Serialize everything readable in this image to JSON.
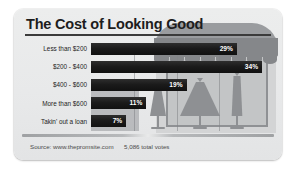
{
  "card": {
    "title": "The Cost of Looking Good",
    "footer": {
      "source_label": "Source: www.thepromsite.com",
      "votes_label": "5,086 total votes"
    }
  },
  "illustration": {
    "name": "dress-shop-storefront",
    "awning": "striped-awning-scalloped",
    "window": "shop-display-window",
    "mannequins": [
      {
        "name": "short-a-line-dress"
      },
      {
        "name": "ball-gown-dress"
      },
      {
        "name": "long-slim-gown-dress"
      }
    ]
  },
  "colors": {
    "card_background": "#eceded",
    "bar_fill": "#1a1a1a",
    "bar_value_text": "#ffffff",
    "title_text": "#1d1d1d",
    "illustration_mid": "#9a9c9f",
    "illustration_dark": "#85878a",
    "window_frame": "#8f9194"
  },
  "chart_data": {
    "type": "bar",
    "orientation": "horizontal",
    "title": "The Cost of Looking Good",
    "xlabel": "",
    "ylabel": "",
    "categories": [
      "Less than $200",
      "$200 - $400",
      "$400 - $600",
      "More than $600",
      "Takin' out a loan"
    ],
    "values": [
      29,
      34,
      19,
      11,
      7
    ],
    "value_labels": [
      "29%",
      "34%",
      "19%",
      "11%",
      "7%"
    ],
    "unit": "%",
    "xlim": [
      0,
      34
    ],
    "grid": true,
    "gridline_count": 3,
    "legend": "none",
    "total_votes": "5,086",
    "source": "www.thepromsite.com"
  }
}
